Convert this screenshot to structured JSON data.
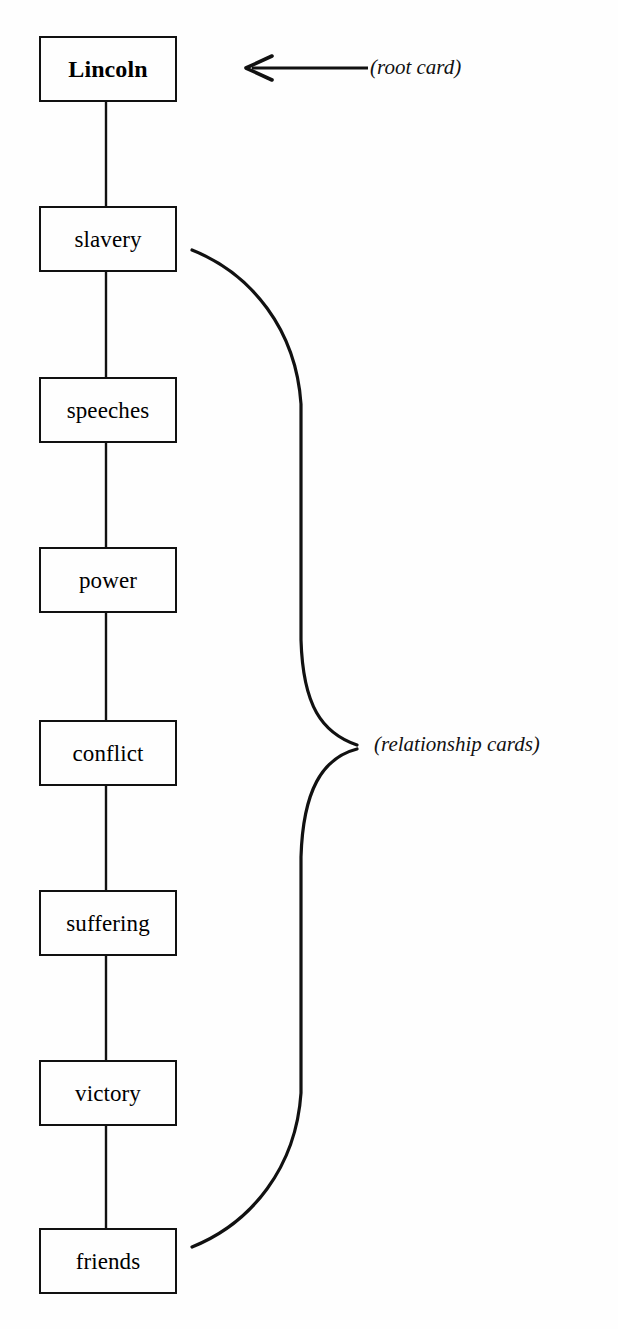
{
  "diagram": {
    "background_color": "#fefefe",
    "line_color": "#111111",
    "cards": [
      {
        "label": "Lincoln",
        "role": "root",
        "x": 39,
        "y": 36,
        "w": 138,
        "h": 66
      },
      {
        "label": "slavery",
        "role": "relationship",
        "x": 39,
        "y": 206,
        "w": 138,
        "h": 66
      },
      {
        "label": "speeches",
        "role": "relationship",
        "x": 39,
        "y": 377,
        "w": 138,
        "h": 66
      },
      {
        "label": "power",
        "role": "relationship",
        "x": 39,
        "y": 547,
        "w": 138,
        "h": 66
      },
      {
        "label": "conflict",
        "role": "relationship",
        "x": 39,
        "y": 720,
        "w": 138,
        "h": 66
      },
      {
        "label": "suffering",
        "role": "relationship",
        "x": 39,
        "y": 890,
        "w": 138,
        "h": 66
      },
      {
        "label": "victory",
        "role": "relationship",
        "x": 39,
        "y": 1060,
        "w": 138,
        "h": 66
      },
      {
        "label": "friends",
        "role": "relationship",
        "x": 39,
        "y": 1228,
        "w": 138,
        "h": 66
      }
    ],
    "annotations": [
      {
        "id": "root-card",
        "text": "(root card)",
        "x": 370,
        "y": 57,
        "pointer": "left-arrow",
        "arrow_from_x": 368,
        "arrow_to_x": 246,
        "arrow_y": 68
      },
      {
        "id": "relationship-cards",
        "text": "(relationship cards)",
        "x": 374,
        "y": 734,
        "pointer": "curly-brace",
        "brace_top_y": 250,
        "brace_bottom_y": 1247,
        "brace_apex_x": 358,
        "brace_apex_y": 745
      }
    ]
  }
}
